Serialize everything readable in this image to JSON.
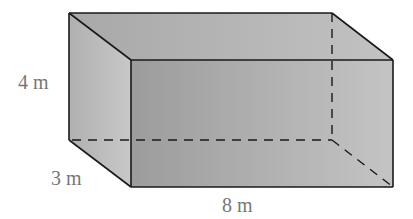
{
  "figure": {
    "type": "rectangular-prism",
    "dimensions": {
      "height": {
        "label": "4 m"
      },
      "depth": {
        "label": "3 m"
      },
      "length": {
        "label": "8 m"
      }
    },
    "colors": {
      "top_face": "#b4b4b4",
      "left_face": "#bdbdbd",
      "front_face": "#a9a9a9",
      "edge": "#1a1a1a",
      "label": "#777777"
    }
  }
}
